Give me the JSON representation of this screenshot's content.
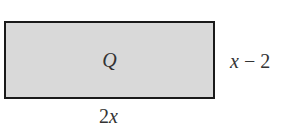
{
  "diagram": {
    "shape": "rectangle",
    "fill_color": "#d9d9d9",
    "border_color": "#1a1a1a",
    "region_label": "Q",
    "height_label": {
      "var": "x",
      "rest": " − 2"
    },
    "width_label": {
      "coef": "2",
      "var": "x"
    }
  }
}
